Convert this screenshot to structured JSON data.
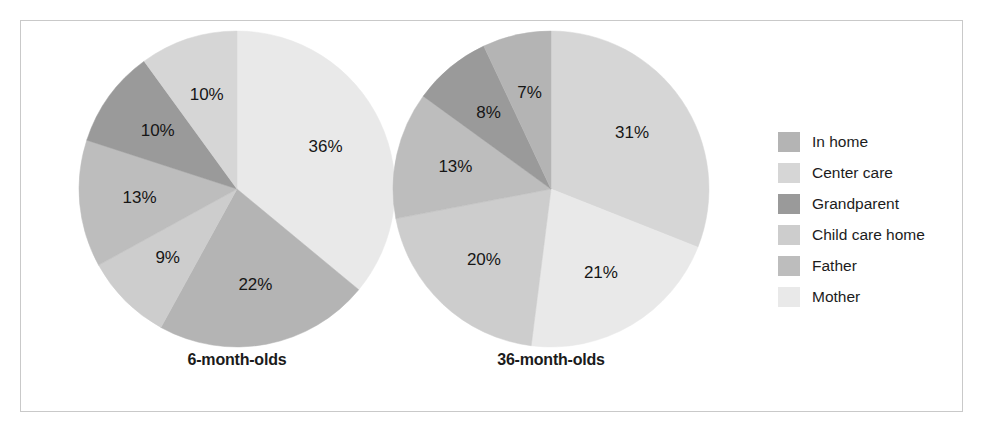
{
  "chart_data": {
    "type": "pie",
    "title": "",
    "subtitle": "",
    "xlabel": "",
    "ylabel": "",
    "grid": false,
    "legend_position": "right",
    "units": "percent",
    "categories": [
      "In home",
      "Center care",
      "Grandparent",
      "Child care home",
      "Father",
      "Mother"
    ],
    "colors": [
      "#b4b4b4",
      "#d6d6d6",
      "#9a9a9a",
      "#cdcdcd",
      "#bdbdbd",
      "#e9e9e9"
    ],
    "charts": [
      {
        "name": "6-month-olds",
        "slices": [
          {
            "category": "Mother",
            "value": 36,
            "label": "36%",
            "color": "#e9e9e9"
          },
          {
            "category": "In home",
            "value": 22,
            "label": "22%",
            "color": "#b4b4b4"
          },
          {
            "category": "Child care home",
            "value": 9,
            "label": "9%",
            "color": "#cdcdcd"
          },
          {
            "category": "Father",
            "value": 13,
            "label": "13%",
            "color": "#bdbdbd"
          },
          {
            "category": "Grandparent",
            "value": 10,
            "label": "10%",
            "color": "#9a9a9a"
          },
          {
            "category": "Center care",
            "value": 10,
            "label": "10%",
            "color": "#d6d6d6"
          }
        ]
      },
      {
        "name": "36-month-olds",
        "slices": [
          {
            "category": "Center care",
            "value": 31,
            "label": "31%",
            "color": "#d6d6d6"
          },
          {
            "category": "Mother",
            "value": 21,
            "label": "21%",
            "color": "#e9e9e9"
          },
          {
            "category": "Child care home",
            "value": 20,
            "label": "20%",
            "color": "#cdcdcd"
          },
          {
            "category": "Father",
            "value": 13,
            "label": "13%",
            "color": "#bdbdbd"
          },
          {
            "category": "Grandparent",
            "value": 8,
            "label": "8%",
            "color": "#9a9a9a"
          },
          {
            "category": "In home",
            "value": 7,
            "label": "7%",
            "color": "#b4b4b4"
          }
        ]
      }
    ]
  },
  "legend": {
    "items": [
      {
        "label": "In home",
        "color": "#b4b4b4"
      },
      {
        "label": "Center care",
        "color": "#d6d6d6"
      },
      {
        "label": "Grandparent",
        "color": "#9a9a9a"
      },
      {
        "label": "Child care home",
        "color": "#cdcdcd"
      },
      {
        "label": "Father",
        "color": "#bdbdbd"
      },
      {
        "label": "Mother",
        "color": "#e9e9e9"
      }
    ]
  },
  "captions": {
    "left": "6-month-olds",
    "right": "36-month-olds"
  },
  "frame": {
    "border_color": "#c9c9c9",
    "background": "#ffffff"
  }
}
